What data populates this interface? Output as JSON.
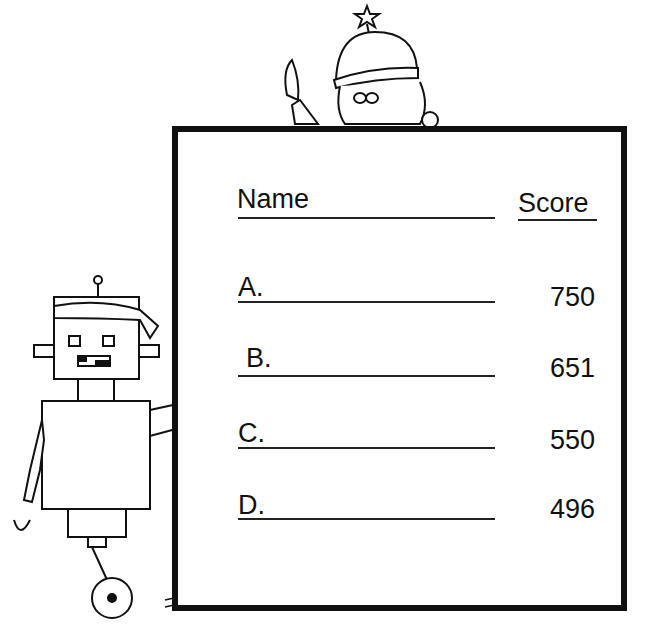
{
  "worksheet": {
    "header": {
      "name_label": "Name",
      "score_label": "Score"
    },
    "rows": [
      {
        "letter": "A.",
        "score": "750"
      },
      {
        "letter": "B.",
        "score": "651"
      },
      {
        "letter": "C.",
        "score": "550"
      },
      {
        "letter": "D.",
        "score": "496"
      }
    ]
  },
  "illustrations": [
    "robot-with-knife",
    "kid-with-star-hat-and-knife",
    "smoke-cloud"
  ]
}
